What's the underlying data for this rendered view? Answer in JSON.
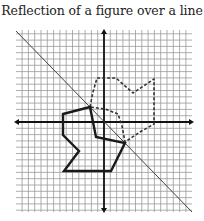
{
  "title": "Reflection of a figure over a line",
  "colors": {
    "grid": "#9a9a9a",
    "axis": "#111111",
    "solid_figure": "#1a1a1a",
    "dashed_figure": "#333333",
    "mirror_line": "#444444",
    "background": "#ffffff"
  },
  "graph": {
    "grid": {
      "x_min_px": 16,
      "x_max_px": 192,
      "y_min_px": 30,
      "y_max_px": 212,
      "origin_px": [
        104,
        122
      ],
      "cell_px": 6.3
    },
    "axes": {
      "x_axis": {
        "from": [
          14,
          122
        ],
        "to": [
          194,
          122
        ],
        "arrows": "both"
      },
      "y_axis": {
        "from": [
          104,
          29
        ],
        "to": [
          104,
          213
        ],
        "arrows": "both"
      }
    },
    "mirror_line": {
      "from": [
        16,
        31
      ],
      "to": [
        192,
        212
      ],
      "description": "line of reflection (y = -x)"
    },
    "original_figure": {
      "style": "solid",
      "points": [
        [
          90,
          107
        ],
        [
          63,
          114
        ],
        [
          63,
          135
        ],
        [
          79,
          151
        ],
        [
          64,
          171
        ],
        [
          111,
          171
        ],
        [
          125,
          143
        ],
        [
          96,
          137
        ]
      ]
    },
    "reflected_figure": {
      "style": "dashed",
      "points": [
        [
          90,
          107
        ],
        [
          93,
          92
        ],
        [
          97,
          78
        ],
        [
          116,
          78
        ],
        [
          133,
          93
        ],
        [
          154,
          79
        ],
        [
          154,
          124
        ],
        [
          140,
          132
        ],
        [
          125,
          142
        ],
        [
          122,
          126
        ],
        [
          118,
          114
        ],
        [
          105,
          109
        ]
      ]
    }
  }
}
